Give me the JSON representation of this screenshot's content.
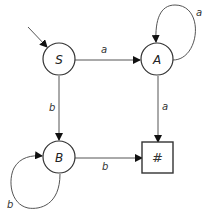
{
  "diagram": {
    "type": "finite-state-automaton",
    "start_state": "S",
    "nodes": [
      {
        "id": "S",
        "label": "S",
        "shape": "circle"
      },
      {
        "id": "A",
        "label": "A",
        "shape": "circle"
      },
      {
        "id": "B",
        "label": "B",
        "shape": "circle"
      },
      {
        "id": "F",
        "label": "#",
        "shape": "square"
      }
    ],
    "edges": [
      {
        "from": "S",
        "to": "A",
        "label": "a"
      },
      {
        "from": "S",
        "to": "B",
        "label": "b"
      },
      {
        "from": "A",
        "to": "A",
        "label": "a"
      },
      {
        "from": "A",
        "to": "F",
        "label": "a"
      },
      {
        "from": "B",
        "to": "B",
        "label": "b"
      },
      {
        "from": "B",
        "to": "F",
        "label": "b"
      }
    ]
  }
}
